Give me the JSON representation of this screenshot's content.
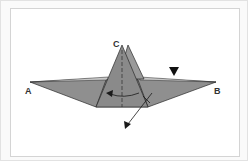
{
  "diagram": {
    "type": "origami-fold-step",
    "labels": {
      "a": "A",
      "b": "B",
      "c": "C"
    },
    "colors": {
      "paper": "#8c8c8c",
      "paper_light": "#a6a6a6",
      "edge": "#2a2a2a",
      "arrow": "#1a1a1a",
      "frame": "#d4d4d4"
    },
    "symbols": [
      "push-in-triangle-marker",
      "valley-fold-dashed-line",
      "curved-fold-arrow",
      "flip-arrow"
    ]
  }
}
